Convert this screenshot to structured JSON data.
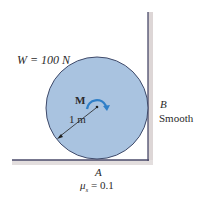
{
  "diagram": {
    "weight_label": "W = 100 N",
    "moment_label": "M",
    "radius_label": "1 m",
    "point_b_label": "B",
    "wall_condition_label": "Smooth",
    "point_a_label": "A",
    "friction_label": "μs = 0.1",
    "friction_symbol": "μ",
    "friction_subscript": "s",
    "friction_value": " = 0.1"
  },
  "colors": {
    "disk_fill": "#a9c3e0",
    "disk_stroke": "#3f4a6a",
    "surface": "#4a4a6a",
    "shadow": "#d6d0d0",
    "moment_arrow": "#2f7fc8",
    "text": "#2a2a2a"
  }
}
